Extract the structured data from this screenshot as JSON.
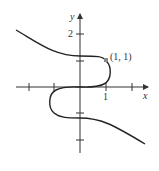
{
  "diagram": {
    "type": "function-graph",
    "axes": {
      "x_label": "x",
      "y_label": "y",
      "x_tick_labels": [
        "1"
      ],
      "y_tick_labels": [
        "2"
      ]
    },
    "point": {
      "label": "(1, 1)",
      "x": 1,
      "y": 1
    },
    "colors": {
      "curve": "#222222",
      "axis": "#333333",
      "point": "#888888"
    }
  }
}
